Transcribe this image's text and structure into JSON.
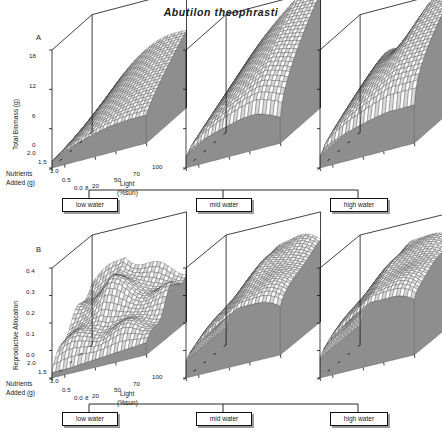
{
  "figure": {
    "title": "Abutilon  theophrasti",
    "panels": [
      {
        "letter": "A",
        "ylabel": "Total Biomass (g)",
        "yticks": [
          "18",
          "12",
          "6",
          "0"
        ],
        "ylim": [
          0,
          18
        ]
      },
      {
        "letter": "B",
        "ylabel": "Reproductive Allocation",
        "yticks": [
          "0.4",
          "0.3",
          "0.2",
          "0.1",
          "0.0"
        ],
        "ylim": [
          0,
          0.4
        ]
      }
    ],
    "nutrient_axis": {
      "label_line1": "Nutrients",
      "label_line2": "Added (g)",
      "ticks": [
        "2.0",
        "1.5",
        "1.0",
        "0.5",
        "0.0"
      ]
    },
    "light_axis": {
      "label_line1": "Light",
      "label_line2": "(%sun)",
      "ticks": [
        "8",
        "20",
        "50",
        "70",
        "100"
      ]
    },
    "water_treatments": [
      {
        "label": "low water"
      },
      {
        "label": "mid water"
      },
      {
        "label": "high water"
      }
    ],
    "colors": {
      "ink": "#111111",
      "mesh": "#2b2b2b",
      "skirt": "#8e8e8e",
      "box_shadow": "#9a9a9a"
    }
  },
  "chart_data": {
    "type": "surface",
    "title": "Abutilon theophrasti",
    "x": {
      "name": "Light",
      "units": "%sun",
      "ticks": [
        8,
        20,
        50,
        70,
        100
      ],
      "range": [
        8,
        100
      ]
    },
    "y": {
      "name": "Nutrients Added",
      "units": "g",
      "ticks": [
        0.0,
        0.5,
        1.0,
        1.5,
        2.0
      ],
      "range": [
        0.0,
        2.0
      ]
    },
    "grid": "on",
    "legend": "none",
    "panels": [
      {
        "letter": "A",
        "zlabel": "Total Biomass (g)",
        "zlim": [
          0,
          18
        ],
        "zticks": [
          0,
          6,
          12,
          18
        ],
        "surfaces": [
          {
            "water": "low water",
            "peak_z": 12,
            "peak_at": {
              "light": 100,
              "nutrients": 2.0
            },
            "shape": "low rounded dome rising from ~1 g at low light/low nutrients to ~12 g at high light and high nutrients"
          },
          {
            "water": "mid water",
            "peak_z": 18,
            "peak_at": {
              "light": 100,
              "nutrients": 2.0
            },
            "shape": "tall ridge reaching ~18 g, steep rise with light, broad plateau at high nutrients"
          },
          {
            "water": "high water",
            "peak_z": 18,
            "peak_at": {
              "light": 100,
              "nutrients": 1.5
            },
            "shape": "tall dome ~18 g with a saddle depression along the back edge"
          }
        ]
      },
      {
        "letter": "B",
        "zlabel": "Reproductive Allocation",
        "zlim": [
          0,
          0.4
        ],
        "zticks": [
          0.0,
          0.1,
          0.2,
          0.3,
          0.4
        ],
        "surfaces": [
          {
            "water": "low water",
            "peak_z": 0.3,
            "peak_at": {
              "light": 20,
              "nutrients": 2.0
            },
            "shape": "rumpled corrugated surface peaking ~0.30 at back-left, falling to ~0.10 at front"
          },
          {
            "water": "mid water",
            "peak_z": 0.33,
            "peak_at": {
              "light": 70,
              "nutrients": 1.5
            },
            "shape": "broad plateau ~0.30-0.33 over most of the surface, dropping at low light"
          },
          {
            "water": "high water",
            "peak_z": 0.33,
            "peak_at": {
              "light": 70,
              "nutrients": 1.0
            },
            "shape": "broad flat-topped plateau ~0.32 with gentle roll-off at the edges"
          }
        ]
      }
    ]
  }
}
